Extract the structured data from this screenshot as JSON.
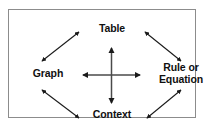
{
  "diagram": {
    "type": "cycle-diagram",
    "background_color": "#ffffff",
    "border_color": "#8c8c8c",
    "arrow_color": "#1a1a1a",
    "text_color": "#101010",
    "nodes": [
      {
        "id": "table",
        "label": "Table",
        "position": "top"
      },
      {
        "id": "graph",
        "label": "Graph",
        "position": "left"
      },
      {
        "id": "rule",
        "label": "Rule or\nEquation",
        "position": "right"
      },
      {
        "id": "context",
        "label": "Context",
        "position": "bottom"
      }
    ],
    "connections": [
      {
        "id": "graph-table",
        "from": "graph",
        "to": "table",
        "style": "double-headed",
        "orientation": "diagonal"
      },
      {
        "id": "table-rule",
        "from": "table",
        "to": "rule",
        "style": "double-headed",
        "orientation": "diagonal"
      },
      {
        "id": "graph-context",
        "from": "graph",
        "to": "context",
        "style": "double-headed",
        "orientation": "diagonal"
      },
      {
        "id": "context-rule",
        "from": "context",
        "to": "rule",
        "style": "double-headed",
        "orientation": "diagonal"
      },
      {
        "id": "graph-rule",
        "from": "graph",
        "to": "rule",
        "style": "double-headed",
        "orientation": "horizontal"
      },
      {
        "id": "table-context",
        "from": "table",
        "to": "context",
        "style": "double-headed",
        "orientation": "vertical"
      }
    ]
  }
}
